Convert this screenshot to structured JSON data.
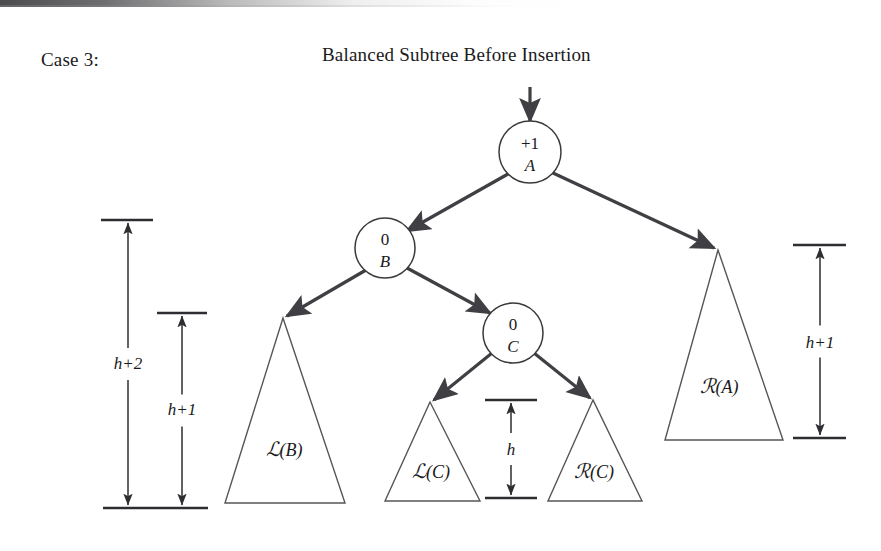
{
  "page": {
    "case_label": "Case 3:",
    "title": "Balanced Subtree Before Insertion",
    "background_color": "#ffffff",
    "ink_color": "#1a1a1a"
  },
  "nodes": [
    {
      "id": "A",
      "balance_factor": "+1",
      "key": "A",
      "cx": 530,
      "cy": 152,
      "r": 31
    },
    {
      "id": "B",
      "balance_factor": "0",
      "key": "B",
      "cx": 385,
      "cy": 248,
      "r": 30
    },
    {
      "id": "C",
      "balance_factor": "0",
      "key": "C",
      "cx": 513,
      "cy": 333,
      "r": 30
    }
  ],
  "subtrees": [
    {
      "id": "L-of-B",
      "script": "ℒ",
      "label": "(B)",
      "full_label": "ℒ(B)",
      "apex_x": 283,
      "apex_y": 318,
      "base_y": 503,
      "base_left_x": 225,
      "base_right_x": 345,
      "text_x": 284,
      "text_y": 456
    },
    {
      "id": "L-of-C",
      "script": "ℒ",
      "label": "(C)",
      "full_label": "ℒ(C)",
      "apex_x": 430,
      "apex_y": 402,
      "base_y": 501,
      "base_left_x": 385,
      "base_right_x": 480,
      "text_x": 431,
      "text_y": 478
    },
    {
      "id": "R-of-C",
      "script": "ℛ",
      "label": "(C)",
      "full_label": "ℛ(C)",
      "apex_x": 593,
      "apex_y": 400,
      "base_y": 501,
      "base_left_x": 548,
      "base_right_x": 642,
      "text_x": 594,
      "text_y": 478
    },
    {
      "id": "R-of-A",
      "script": "ℛ",
      "label": "(A)",
      "full_label": "ℛ(A)",
      "apex_x": 718,
      "apex_y": 250,
      "base_y": 440,
      "base_left_x": 665,
      "base_right_x": 783,
      "text_x": 719,
      "text_y": 393
    }
  ],
  "edges": [
    {
      "id": "entry-arrow-to-A",
      "from": "above",
      "to": "A",
      "x1": 530,
      "y1": 87,
      "x2": 530,
      "y2": 121
    },
    {
      "id": "A-to-B",
      "from": "A",
      "to": "B",
      "x1": 508,
      "y1": 174,
      "x2": 407,
      "y2": 231
    },
    {
      "id": "A-to-R-of-A",
      "from": "A",
      "to": "R-of-A",
      "x1": 553,
      "y1": 173,
      "x2": 714,
      "y2": 248
    },
    {
      "id": "B-to-L-of-B",
      "from": "B",
      "to": "L-of-B",
      "x1": 366,
      "y1": 270,
      "x2": 287,
      "y2": 316
    },
    {
      "id": "B-to-C",
      "from": "B",
      "to": "C",
      "x1": 407,
      "y1": 268,
      "x2": 490,
      "y2": 313
    },
    {
      "id": "C-to-L-of-C",
      "from": "C",
      "to": "L-of-C",
      "x1": 492,
      "y1": 353,
      "x2": 434,
      "y2": 400
    },
    {
      "id": "C-to-R-of-C",
      "from": "C",
      "to": "R-of-C",
      "x1": 534,
      "y1": 353,
      "x2": 590,
      "y2": 398
    }
  ],
  "measurements": [
    {
      "id": "height-h-plus-2",
      "label": "h+2",
      "axis_x": 128,
      "top_y": 220,
      "bottom_y": 508,
      "top_bar_x1": 101,
      "top_bar_x2": 153,
      "bottom_bar_x1": 103,
      "bottom_bar_x2": 208,
      "text_x": 128,
      "text_y": 369,
      "show_bottom_bar": true
    },
    {
      "id": "height-h-plus-1-left",
      "label": "h+1",
      "axis_x": 182,
      "top_y": 313,
      "bottom_y": 508,
      "top_bar_x1": 157,
      "top_bar_x2": 207,
      "bottom_bar_x1": 0,
      "bottom_bar_x2": 0,
      "text_x": 182,
      "text_y": 415,
      "show_bottom_bar": false
    },
    {
      "id": "height-h",
      "label": "h",
      "axis_x": 511,
      "top_y": 400,
      "bottom_y": 498,
      "top_bar_x1": 485,
      "top_bar_x2": 537,
      "bottom_bar_x1": 485,
      "bottom_bar_x2": 537,
      "text_x": 511,
      "text_y": 455,
      "show_bottom_bar": true
    },
    {
      "id": "height-h-plus-1-right",
      "label": "h+1",
      "axis_x": 820,
      "top_y": 245,
      "bottom_y": 438,
      "top_bar_x1": 793,
      "top_bar_x2": 846,
      "bottom_bar_x1": 793,
      "bottom_bar_x2": 846,
      "text_x": 820,
      "text_y": 348,
      "show_bottom_bar": true
    }
  ]
}
